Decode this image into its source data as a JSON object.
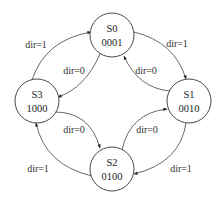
{
  "diagram": {
    "type": "state-machine",
    "states": [
      {
        "id": "S0",
        "name": "S0",
        "code": "0001"
      },
      {
        "id": "S1",
        "name": "S1",
        "code": "0010"
      },
      {
        "id": "S2",
        "name": "S2",
        "code": "0100"
      },
      {
        "id": "S3",
        "name": "S3",
        "code": "1000"
      }
    ],
    "transitions": [
      {
        "from": "S0",
        "to": "S1",
        "label": "dir=1"
      },
      {
        "from": "S1",
        "to": "S2",
        "label": "dir=1"
      },
      {
        "from": "S2",
        "to": "S3",
        "label": "dir=1"
      },
      {
        "from": "S3",
        "to": "S0",
        "label": "dir=1"
      },
      {
        "from": "S0",
        "to": "S3",
        "label": "dir=0"
      },
      {
        "from": "S3",
        "to": "S2",
        "label": "dir=0"
      },
      {
        "from": "S2",
        "to": "S1",
        "label": "dir=0"
      },
      {
        "from": "S1",
        "to": "S0",
        "label": "dir=0"
      }
    ]
  }
}
